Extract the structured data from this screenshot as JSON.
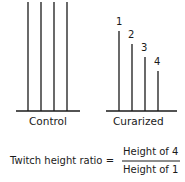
{
  "diagram": {
    "groups": [
      {
        "label": "Control",
        "twitch_heights": [
          109,
          109,
          109,
          109
        ]
      },
      {
        "label": "Curarized",
        "twitch_heights": [
          80,
          67,
          54,
          40
        ],
        "twitch_labels": [
          "1",
          "2",
          "3",
          "4"
        ]
      }
    ],
    "formula": {
      "lhs": "Twitch height ratio =",
      "numerator": "Height of 4",
      "denominator": "Height of 1"
    },
    "colors": {
      "line": "#1a1a1a",
      "background": "#ffffff"
    }
  }
}
